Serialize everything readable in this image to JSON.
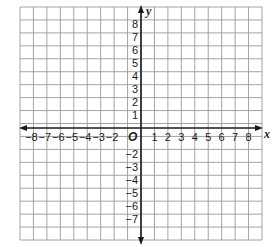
{
  "diagram": {
    "type": "coordinate-plane",
    "grid": {
      "columns": 18,
      "rows": 18,
      "color": "#9a9a9a"
    },
    "axes": {
      "x": {
        "label": "x",
        "min": -8,
        "max": 8,
        "ticks": [
          "-8",
          "-7",
          "-6",
          "-5",
          "-4",
          "-3",
          "-2",
          "1",
          "2",
          "3",
          "4",
          "5",
          "6",
          "7",
          "8"
        ]
      },
      "y": {
        "label": "y",
        "min": -7,
        "max": 8,
        "ticks": [
          "8",
          "7",
          "6",
          "5",
          "4",
          "3",
          "2",
          "1",
          "-2",
          "-3",
          "-4",
          "-5",
          "-6",
          "-7"
        ]
      },
      "origin_label": "O",
      "color": "#1a1a1a"
    }
  }
}
